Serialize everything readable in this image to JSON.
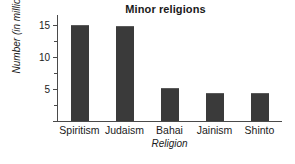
{
  "chart_data": {
    "type": "bar",
    "title": "Minor religions",
    "xlabel": "Religion",
    "ylabel": "Number (in millions)",
    "categories": [
      "Spiritism",
      "Judaism",
      "Bahai",
      "Jainism",
      "Shinto"
    ],
    "values": [
      15.0,
      14.8,
      5.2,
      4.4,
      4.4
    ],
    "ylim": [
      0,
      16.5
    ],
    "ytick_labels": [
      "5",
      "10",
      "15"
    ],
    "ytick_values": [
      5,
      10,
      15
    ],
    "yminor_values": [
      2.5,
      7.5,
      12.5
    ],
    "grid": false,
    "legend": null,
    "bar_color": "#3a3a3a",
    "axis_color": "#4a4a4a",
    "background": "#ffffff"
  }
}
